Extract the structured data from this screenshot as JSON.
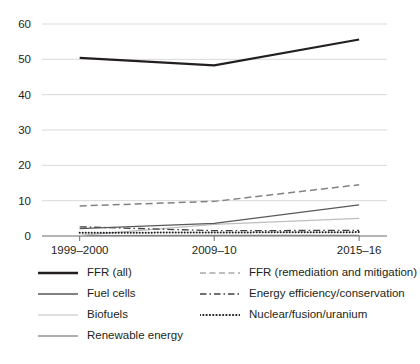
{
  "chart_data": {
    "type": "line",
    "title": "",
    "subtitle": "",
    "xlabel": "",
    "ylabel": "",
    "categories": [
      "1999–2000",
      "2009–10",
      "2015–16"
    ],
    "yticks": [
      0,
      10,
      20,
      30,
      40,
      50,
      60
    ],
    "ylim": [
      0,
      60
    ],
    "grid": "horizontal",
    "legend_position": "bottom",
    "series": [
      {
        "name": "FFR (all)",
        "values": [
          50.4,
          48.3,
          55.6
        ],
        "style": "solid",
        "color": "#231f20",
        "width": 2.1
      },
      {
        "name": "FFR (remediation and mitigation)",
        "values": [
          8.5,
          9.8,
          14.5
        ],
        "style": "dashed",
        "color": "#808285",
        "width": 1.5
      },
      {
        "name": "Fuel cells",
        "values": [
          2.1,
          3.6,
          8.8
        ],
        "style": "solid",
        "color": "#58595b",
        "width": 1.3
      },
      {
        "name": "Energy efficiency/conservation",
        "values": [
          2.6,
          1.5,
          1.6
        ],
        "style": "dash-dot",
        "color": "#414042",
        "width": 1.3
      },
      {
        "name": "Biofuels",
        "values": [
          0.2,
          3.3,
          5.0
        ],
        "style": "solid",
        "color": "#bcbec0",
        "width": 1.3
      },
      {
        "name": "Nuclear/fusion/uranium",
        "values": [
          0.9,
          1.0,
          1.1
        ],
        "style": "dotted",
        "color": "#231f20",
        "width": 2.0
      },
      {
        "name": "Renewable energy",
        "values": [
          0.1,
          0.2,
          0.2
        ],
        "style": "solid",
        "color": "#808285",
        "width": 1.2
      }
    ]
  },
  "legend": {
    "left_column": [
      {
        "label": "FFR (all)",
        "style": "solid",
        "color": "#231f20",
        "width": 2.4
      },
      {
        "label": "Fuel cells",
        "style": "solid",
        "color": "#58595b",
        "width": 1.6
      },
      {
        "label": "Biofuels",
        "style": "solid",
        "color": "#d1d3d4",
        "width": 1.6
      },
      {
        "label": "Renewable energy",
        "style": "solid",
        "color": "#939598",
        "width": 1.6
      }
    ],
    "right_column": [
      {
        "label": "FFR (remediation and mitigation)",
        "style": "dashed",
        "color": "#a7a9ac",
        "width": 1.6
      },
      {
        "label": "Energy efficiency/conservation",
        "style": "dash-dot",
        "color": "#414042",
        "width": 1.6
      },
      {
        "label": "Nuclear/fusion/uranium",
        "style": "dotted",
        "color": "#231f20",
        "width": 2.2
      }
    ]
  },
  "axes": {
    "y_tick_labels": [
      "60",
      "50",
      "40",
      "30",
      "20",
      "10",
      "0"
    ],
    "x_tick_labels": [
      "1999–2000",
      "2009–10",
      "2015–16"
    ]
  },
  "colors": {
    "grid": "#d9d9d9",
    "axis": "#6d6e71",
    "text": "#231f20",
    "background": "#ffffff"
  }
}
